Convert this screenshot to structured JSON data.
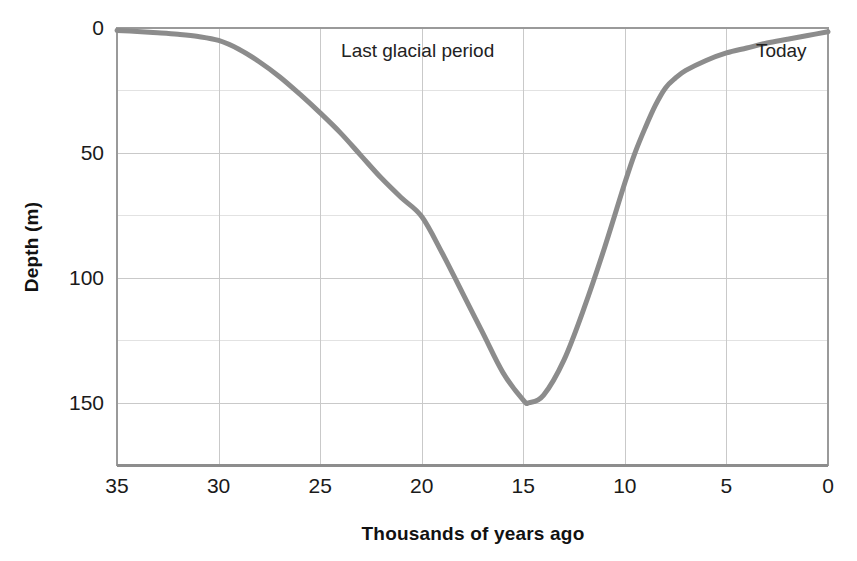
{
  "chart_data": {
    "type": "line",
    "title": "",
    "xlabel": "Thousands of years ago",
    "ylabel": "Depth (m)",
    "xlim": [
      35,
      0
    ],
    "ylim": [
      175,
      0
    ],
    "x_inverted": true,
    "y_inverted": true,
    "grid": true,
    "legend_position": "none",
    "x_ticks": [
      "35",
      "30",
      "25",
      "20",
      "15",
      "10",
      "5",
      "0"
    ],
    "x_tick_values": [
      35,
      30,
      25,
      20,
      15,
      10,
      5,
      0
    ],
    "y_ticks": [
      "0",
      "50",
      "100",
      "150"
    ],
    "y_tick_values": [
      0,
      50,
      100,
      150
    ],
    "y_gridline_values": [
      0,
      25,
      50,
      75,
      100,
      125,
      150,
      175
    ],
    "x_gridline_values": [
      30,
      25,
      20,
      15,
      10,
      5
    ],
    "series_name": "Sea level depth below present",
    "series_color": "#8c8c8c",
    "series_width_px": 5,
    "x": [
      35.0,
      34.0,
      33.0,
      32.0,
      31.0,
      30.0,
      29.0,
      28.0,
      27.0,
      26.0,
      25.0,
      24.0,
      23.0,
      22.0,
      21.0,
      20.0,
      19.0,
      18.0,
      17.0,
      16.0,
      15.0,
      14.7,
      14.0,
      13.0,
      12.0,
      11.0,
      10.0,
      9.5,
      9.0,
      8.5,
      8.0,
      7.5,
      7.0,
      6.0,
      5.0,
      4.0,
      3.0,
      2.0,
      1.0,
      0.0
    ],
    "values": [
      1.0,
      1.4,
      1.9,
      2.5,
      3.4,
      5.0,
      8.5,
      13.5,
      19.5,
      26.5,
      34.0,
      42.0,
      51.0,
      60.0,
      68.0,
      75.5,
      90.0,
      106.0,
      122.0,
      138.0,
      149.0,
      150.0,
      147.0,
      133.0,
      112.0,
      88.0,
      62.0,
      50.0,
      40.0,
      31.0,
      24.0,
      20.0,
      17.0,
      13.0,
      10.0,
      8.0,
      6.0,
      4.5,
      3.0,
      1.5
    ],
    "annotations": [
      {
        "label": "Last glacial period",
        "x": 20.2,
        "y_px": 57
      },
      {
        "label": "Today",
        "x": 2.3,
        "y_px": 57
      }
    ]
  },
  "plot": {
    "left_px": 117,
    "right_px": 828,
    "top_px": 28,
    "bottom_px": 465
  }
}
